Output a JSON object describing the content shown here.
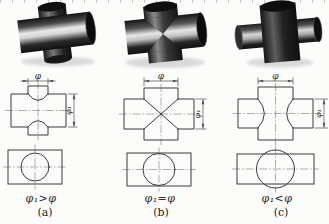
{
  "figure": {
    "columns": [
      {
        "letter": "(a)",
        "relation": "φ₁>φ",
        "dim_top": "φ",
        "dim_side": "φ₁"
      },
      {
        "letter": "(b)",
        "relation": "φ₁=φ",
        "dim_top": "φ",
        "dim_side": "φ₁"
      },
      {
        "letter": "(c)",
        "relation": "φ₁<φ",
        "dim_top": "φ",
        "dim_side": "φ₁"
      }
    ]
  },
  "colors": {
    "outline": "#3a3a3a",
    "dimension": "#4f4f4f",
    "centerline": "#6a6a6a",
    "background": "#fcfcfb",
    "metal_dark": "#121212",
    "metal_highlight": "#e9e9e9"
  }
}
